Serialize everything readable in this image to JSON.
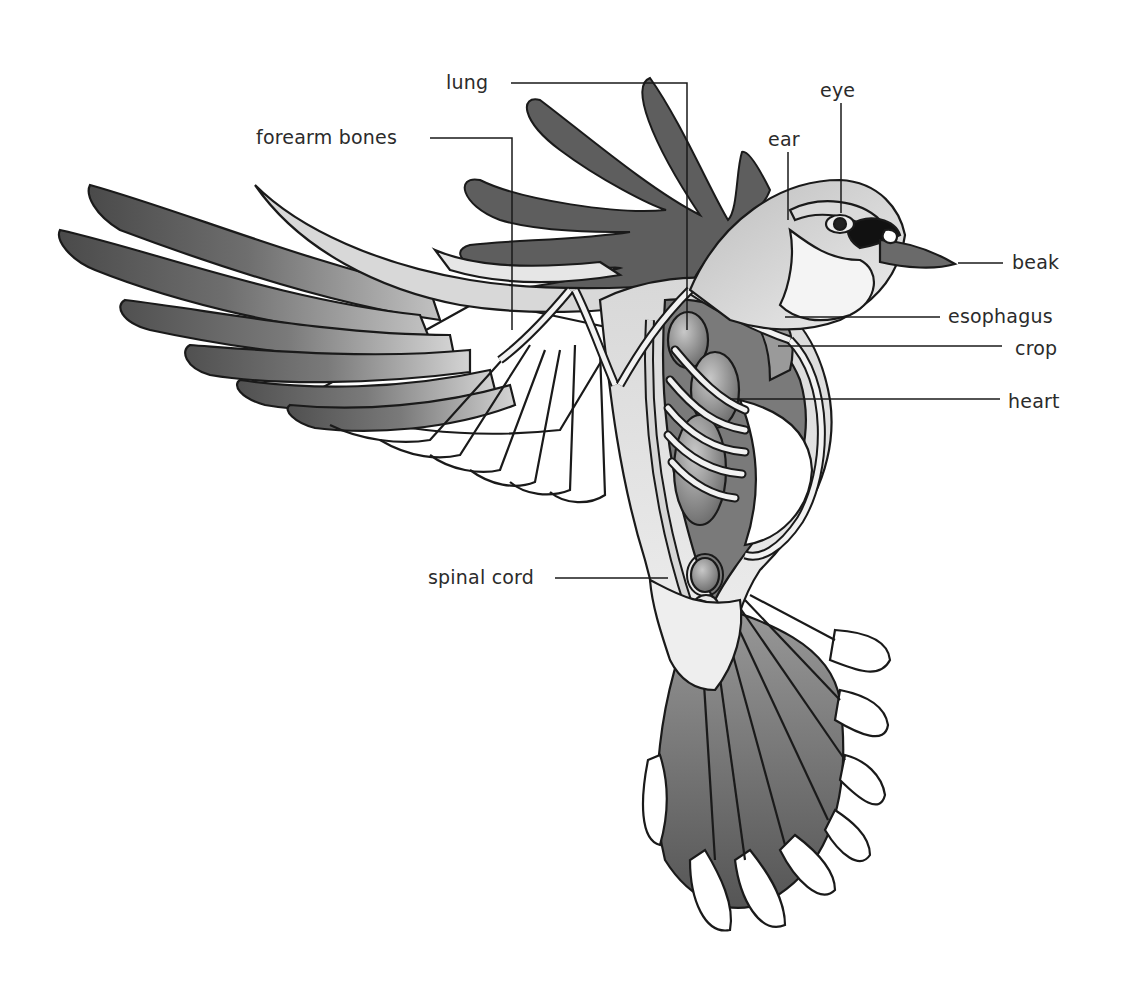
{
  "diagram": {
    "colors": {
      "background": "#ffffff",
      "outline": "#1a1a1a",
      "dark_feather": "#5e5e5e",
      "mid_gray": "#8a8a8a",
      "light_gray": "#c9c9c9",
      "pale": "#e4e4e4",
      "label_text": "#2b2b2b"
    },
    "labels": {
      "lung": "lung",
      "forearm_bones": "forearm bones",
      "eye": "eye",
      "ear": "ear",
      "beak": "beak",
      "esophagus": "esophagus",
      "crop": "crop",
      "heart": "heart",
      "spinal_cord": "spinal cord"
    }
  }
}
